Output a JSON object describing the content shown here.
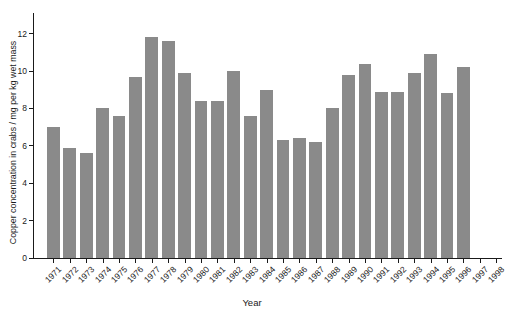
{
  "figure": {
    "background_color": "#ffffff",
    "bar_color": "#8a8a8a",
    "axis_color": "#1a1a1a",
    "text_color": "#1a1a1a"
  },
  "chart_data": {
    "type": "bar",
    "title": "",
    "xlabel": "Year",
    "ylabel": "Copper concentration in crabs / mg per kg wet mass",
    "categories": [
      "1971",
      "1972",
      "1973",
      "1974",
      "1975",
      "1976",
      "1977",
      "1978",
      "1979",
      "1980",
      "1981",
      "1982",
      "1983",
      "1984",
      "1985",
      "1986",
      "1987",
      "1988",
      "1989",
      "1990",
      "1991",
      "1992",
      "1993",
      "1994",
      "1995",
      "1996",
      "1997",
      "1998"
    ],
    "values": [
      7.0,
      5.9,
      5.6,
      8.0,
      7.6,
      9.7,
      11.8,
      11.6,
      9.9,
      8.4,
      8.4,
      10.0,
      7.6,
      9.0,
      6.3,
      6.4,
      6.2,
      8.0,
      9.8,
      10.4,
      8.9,
      8.9,
      9.9,
      10.9,
      8.8,
      10.2,
      null,
      null
    ],
    "ylim": [
      0,
      13.1
    ],
    "yticks": [
      0,
      2,
      4,
      6,
      8,
      10,
      12
    ],
    "grid": false,
    "legend": null
  }
}
